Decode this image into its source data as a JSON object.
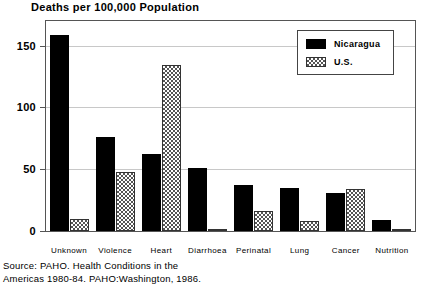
{
  "chart_data": {
    "type": "bar",
    "title": "Deaths per 100,000 Population",
    "xlabel": "",
    "ylabel": "",
    "ylim": [
      0,
      170
    ],
    "yticks": [
      0,
      50,
      100,
      150
    ],
    "grid": true,
    "legend_position": "top-right",
    "categories": [
      "Unknown",
      "Violence",
      "Heart",
      "Diarrhoea",
      "Perinatal",
      "Lung",
      "Cancer",
      "Nutrition"
    ],
    "series": [
      {
        "name": "Nicaragua",
        "color": "#000000",
        "pattern": "solid",
        "values": [
          159,
          76,
          62,
          51,
          37,
          35,
          31,
          9
        ]
      },
      {
        "name": "U.S.",
        "color": "#555555",
        "pattern": "checkered",
        "values": [
          10,
          48,
          134,
          2,
          16,
          8,
          34,
          1
        ]
      }
    ]
  },
  "source": {
    "line1": "Source: PAHO. Health Conditions in the",
    "line2": "Americas 1980-84. PAHO:Washington, 1986."
  }
}
